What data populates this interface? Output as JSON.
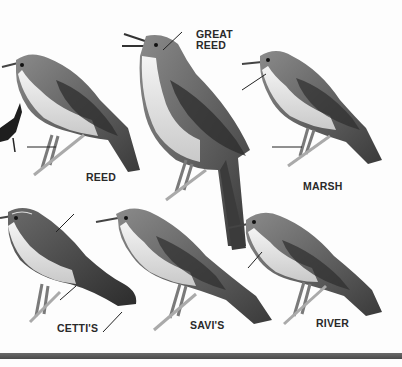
{
  "plate": {
    "subject": "Warblers identification plate",
    "colors": {
      "background": "#fdfdfd",
      "ink": "#2a2a2a",
      "bar": "#555555"
    },
    "birds": [
      {
        "id": "reed",
        "label": "REED"
      },
      {
        "id": "great-reed",
        "label_line1": "GREAT",
        "label_line2": "REED"
      },
      {
        "id": "marsh",
        "label": "MARSH"
      },
      {
        "id": "cettis",
        "label": "CETTI'S"
      },
      {
        "id": "savis",
        "label": "SAVI'S"
      },
      {
        "id": "river",
        "label": "RIVER"
      }
    ]
  }
}
